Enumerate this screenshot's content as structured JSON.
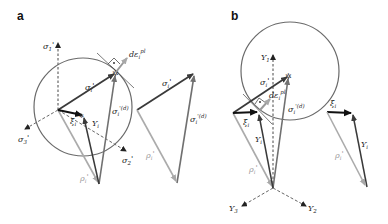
{
  "figure": {
    "panels": [
      {
        "id": "a",
        "label": "a",
        "axes": {
          "sigma1": {
            "base": "σ",
            "sub": "1",
            "sup": "'"
          },
          "sigma2": {
            "base": "σ",
            "sub": "2",
            "sup": "'"
          },
          "sigma3": {
            "base": "σ",
            "sub": "3",
            "sup": "'"
          }
        },
        "vectors": {
          "sigma_i": {
            "base": "σ",
            "sub": "i",
            "sup": "'"
          },
          "sigma_tid": {
            "base": "σ",
            "sub": "i",
            "sup": "'(d)"
          },
          "rho_i": {
            "base": "ρ",
            "sub": "i",
            "sup": "'"
          },
          "Y_i": {
            "base": "Y",
            "sub": "i"
          },
          "xi_i": {
            "base": "ξ",
            "sub": "i"
          },
          "d_eps": {
            "base": "dε",
            "sub": "i",
            "sup": "pl"
          }
        },
        "copy": {
          "sigma_i": {
            "base": "σ",
            "sub": "i",
            "sup": "'"
          },
          "sigma_tid": {
            "base": "σ",
            "sub": "i",
            "sup": "'(d)"
          },
          "rho_i": {
            "base": "ρ",
            "sub": "i",
            "sup": "'"
          }
        }
      },
      {
        "id": "b",
        "label": "b",
        "axes": {
          "Y1": {
            "base": "Y",
            "sub": "1"
          },
          "Y2": {
            "base": "Y",
            "sub": "2"
          },
          "Y3": {
            "base": "Y",
            "sub": "3"
          }
        },
        "vectors": {
          "sigma_i": {
            "base": "σ",
            "sub": "i",
            "sup": "'"
          },
          "sigma_tid": {
            "base": "σ",
            "sub": "i",
            "sup": "'(d)"
          },
          "rho_i": {
            "base": "ρ",
            "sub": "i",
            "sup": "'"
          },
          "Y_i": {
            "base": "Y",
            "sub": "i"
          },
          "xi_i": {
            "base": "ξ",
            "sub": "i"
          },
          "d_eps": {
            "base": "dε",
            "sub": "i",
            "sup": "pl"
          }
        },
        "copy": {
          "xi_i": {
            "base": "ξ",
            "sub": "i"
          },
          "Y_i": {
            "base": "Y",
            "sub": "i"
          },
          "rho_i": {
            "base": "ρ",
            "sub": "i",
            "sup": "'"
          }
        }
      }
    ],
    "colors": {
      "dark": "#3a3a3a",
      "mid": "#6e6e6e",
      "light": "#ababab",
      "circle": "#6a6a6a",
      "black": "#111111"
    }
  }
}
